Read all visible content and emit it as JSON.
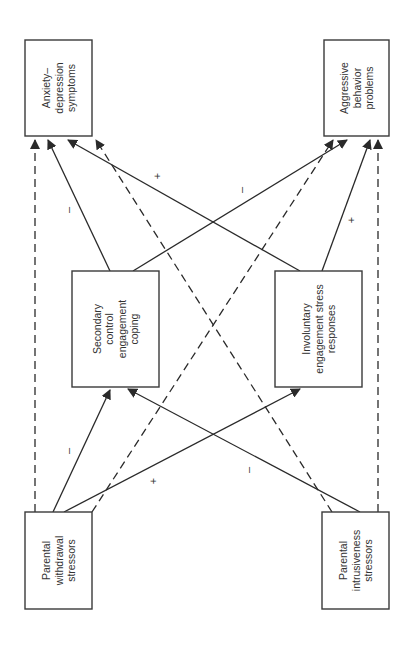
{
  "diagram": {
    "type": "path-model",
    "orientation": "rotated-90-ccw",
    "nodes": [
      {
        "id": "anxiety",
        "lines": [
          "Anxiety–",
          "depression",
          "symptoms"
        ],
        "box": [
          25,
          40,
          67,
          96
        ]
      },
      {
        "id": "aggressive",
        "lines": [
          "Aggressive",
          "behavior",
          "problems"
        ],
        "box": [
          324,
          40,
          65,
          96
        ]
      },
      {
        "id": "secondary",
        "lines": [
          "Secondary",
          "control",
          "engagement",
          "coping"
        ],
        "box": [
          72,
          271,
          87,
          116
        ]
      },
      {
        "id": "involuntary",
        "lines": [
          "Involuntary",
          "engagement stress",
          "responses"
        ],
        "box": [
          275,
          271,
          87,
          116
        ]
      },
      {
        "id": "withdrawal",
        "lines": [
          "Parental",
          "withdrawal",
          "stressors"
        ],
        "box": [
          25,
          512,
          67,
          97
        ]
      },
      {
        "id": "intrusiveness",
        "lines": [
          "Parental",
          "intrusiveness",
          "stressors"
        ],
        "box": [
          322,
          512,
          67,
          97
        ]
      }
    ],
    "edges": [
      {
        "from": "withdrawal",
        "to": "anxiety",
        "style": "dashed",
        "x1": 35,
        "y1": 512,
        "x2": 35,
        "y2": 140,
        "sign": ""
      },
      {
        "from": "withdrawal",
        "to": "secondary",
        "style": "solid",
        "x1": 53,
        "y1": 512,
        "x2": 110,
        "y2": 390,
        "sign": "–",
        "sx": 69,
        "sy": 451
      },
      {
        "from": "withdrawal",
        "to": "involuntary",
        "style": "solid",
        "x1": 64,
        "y1": 512,
        "x2": 300,
        "y2": 389,
        "sign": "+",
        "sx": 154,
        "sy": 481
      },
      {
        "from": "withdrawal",
        "to": "aggressive",
        "style": "dashed",
        "x1": 92,
        "y1": 512,
        "x2": 333,
        "y2": 140,
        "sign": ""
      },
      {
        "from": "secondary",
        "to": "anxiety",
        "style": "solid",
        "x1": 110,
        "y1": 271,
        "x2": 48,
        "y2": 140,
        "sign": "–",
        "sx": 69,
        "sy": 210
      },
      {
        "from": "secondary",
        "to": "aggressive",
        "style": "solid",
        "x1": 133,
        "y1": 271,
        "x2": 347,
        "y2": 140,
        "sign": "–",
        "sx": 242,
        "sy": 190
      },
      {
        "from": "involuntary",
        "to": "anxiety",
        "style": "solid",
        "x1": 300,
        "y1": 271,
        "x2": 68,
        "y2": 140,
        "sign": "+",
        "sx": 158,
        "sy": 176
      },
      {
        "from": "involuntary",
        "to": "aggressive",
        "style": "solid",
        "x1": 322,
        "y1": 271,
        "x2": 370,
        "y2": 140,
        "sign": "+",
        "sx": 352,
        "sy": 220
      },
      {
        "from": "intrusiveness",
        "to": "anxiety",
        "style": "dashed",
        "x1": 332,
        "y1": 512,
        "x2": 96,
        "y2": 140,
        "sign": ""
      },
      {
        "from": "intrusiveness",
        "to": "secondary",
        "style": "solid",
        "x1": 360,
        "y1": 512,
        "x2": 128,
        "y2": 389,
        "sign": "–",
        "sx": 249,
        "sy": 470
      },
      {
        "from": "intrusiveness",
        "to": "aggressive",
        "style": "dashed",
        "x1": 378,
        "y1": 512,
        "x2": 378,
        "y2": 140,
        "sign": ""
      }
    ]
  },
  "colors": {
    "stroke": "#2a2a2a",
    "text": "#333333",
    "background": "#ffffff"
  }
}
